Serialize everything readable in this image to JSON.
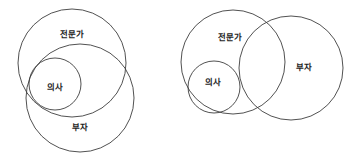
{
  "figure": {
    "background_color": "#ffffff",
    "stroke_color": "#3d3d3d",
    "label_color": "#1c1c1c",
    "width": 348,
    "height": 167
  },
  "diagrams": [
    {
      "id": "left",
      "name": "left-venn-diagram",
      "description": "의사 ⊂ (전문가 ∩ 부자), 전문가와 부자가 크게 겹침",
      "circles": [
        {
          "name": "expert",
          "label": "전문가",
          "cx": 72,
          "cy": 63,
          "r": 54,
          "label_x": 72,
          "label_y": 34
        },
        {
          "name": "rich",
          "label": "부자",
          "cx": 80,
          "cy": 98,
          "r": 54,
          "label_x": 80,
          "label_y": 127
        },
        {
          "name": "doctor",
          "label": "의사",
          "cx": 55,
          "cy": 84,
          "r": 26,
          "label_x": 55,
          "label_y": 87
        }
      ]
    },
    {
      "id": "right",
      "name": "right-venn-diagram",
      "description": "의사 ⊂ 전문가, 전문가와 부자가 부분적으로 겹침",
      "circles": [
        {
          "name": "expert",
          "label": "전문가",
          "cx": 233,
          "cy": 62,
          "r": 52,
          "label_x": 230,
          "label_y": 37
        },
        {
          "name": "rich",
          "label": "부자",
          "cx": 291,
          "cy": 68,
          "r": 52,
          "label_x": 304,
          "label_y": 67
        },
        {
          "name": "doctor",
          "label": "의사",
          "cx": 214,
          "cy": 87,
          "r": 26,
          "label_x": 213,
          "label_y": 82
        }
      ]
    }
  ],
  "labels": {
    "expert": "전문가",
    "rich": "부자",
    "doctor": "의사"
  }
}
